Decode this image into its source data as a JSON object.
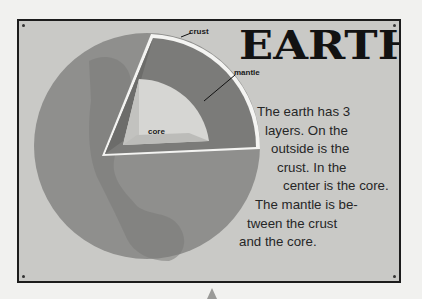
{
  "title": "EARTH",
  "labels": {
    "crust": "crust",
    "mantle": "mantle",
    "core": "core"
  },
  "description_lines": [
    "The earth has 3",
    "layers. On the",
    "outside is the",
    "crust. In the",
    "center is the core.",
    "The mantle is be-",
    "tween the crust",
    "and the core."
  ],
  "colors": {
    "panel_bg": "#c9c9c6",
    "globe": "#8e8e8c",
    "mantle": "#7c7c7a",
    "core": "#d9d9d6",
    "crust": "#f4f4f2"
  }
}
